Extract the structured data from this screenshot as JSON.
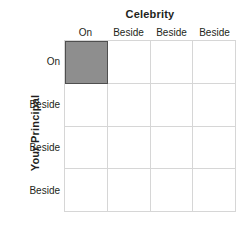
{
  "chart_data": {
    "type": "heatmap",
    "title": "",
    "xlabel": "Celebrity",
    "ylabel": "Your Principal",
    "x_categories": [
      "On",
      "Beside",
      "Beside",
      "Beside"
    ],
    "y_categories": [
      "On",
      "Beside",
      "Beside",
      "Beside"
    ],
    "grid": true,
    "legend": "none",
    "values": [
      [
        1,
        0,
        0,
        0
      ],
      [
        0,
        0,
        0,
        0
      ],
      [
        0,
        0,
        0,
        0
      ],
      [
        0,
        0,
        0,
        0
      ]
    ],
    "annotations": [
      {
        "row": 0,
        "col": 0,
        "state": "filled",
        "row_label": "On",
        "col_label": "On"
      }
    ],
    "colors": {
      "filled_cell": "#8e8e8e",
      "filled_cell_border": "#4f4f4f",
      "empty_cell": "#ffffff",
      "gridline": "#d6d6d6",
      "text": "#231f20",
      "background": "#ffffff"
    }
  },
  "axes": {
    "column": {
      "title": "Celebrity",
      "headers": [
        {
          "label": "On"
        },
        {
          "label": "Beside"
        },
        {
          "label": "Beside"
        },
        {
          "label": "Beside"
        }
      ]
    },
    "row": {
      "title": "Your Principal",
      "headers": [
        {
          "label": "On"
        },
        {
          "label": "Beside"
        },
        {
          "label": "Beside"
        },
        {
          "label": "Beside"
        }
      ]
    }
  }
}
